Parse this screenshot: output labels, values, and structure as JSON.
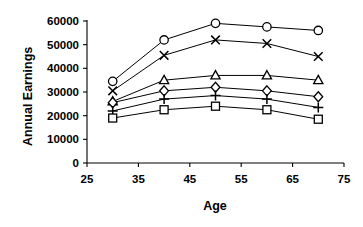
{
  "chart_data": {
    "type": "line",
    "title": "",
    "xlabel": "Age",
    "ylabel": "Annual Earnings",
    "x": [
      30,
      40,
      50,
      60,
      70
    ],
    "xlim": [
      25,
      75
    ],
    "ylim": [
      0,
      60000
    ],
    "xticks": [
      25,
      35,
      45,
      55,
      65,
      75
    ],
    "yticks": [
      0,
      10000,
      20000,
      30000,
      40000,
      50000,
      60000
    ],
    "xtick_labels": [
      "25",
      "35",
      "45",
      "55",
      "65",
      "75"
    ],
    "ytick_labels": [
      "0",
      "10000",
      "20000",
      "30000",
      "40000",
      "50000",
      "60000"
    ],
    "grid": false,
    "legend": "none",
    "line_color": "#000000",
    "marker_fill": "#ffffff",
    "series": [
      {
        "name": "series-circle",
        "marker": "circle",
        "values": [
          34500,
          52000,
          59000,
          57500,
          56000
        ]
      },
      {
        "name": "series-x",
        "marker": "x",
        "values": [
          30500,
          45500,
          52000,
          50500,
          45000
        ]
      },
      {
        "name": "series-triangle",
        "marker": "triangle",
        "values": [
          26000,
          35000,
          37000,
          37000,
          35000
        ]
      },
      {
        "name": "series-diamond",
        "marker": "diamond",
        "values": [
          25500,
          30500,
          32000,
          30500,
          28000
        ]
      },
      {
        "name": "series-plus",
        "marker": "plus",
        "values": [
          22000,
          27000,
          28500,
          27000,
          23500
        ]
      },
      {
        "name": "series-square",
        "marker": "square",
        "values": [
          19000,
          22500,
          24000,
          22500,
          18500
        ]
      }
    ]
  }
}
